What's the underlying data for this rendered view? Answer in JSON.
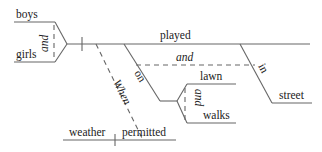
{
  "diagram": {
    "type": "sentence-diagram",
    "subjects": [
      "boys",
      "girls"
    ],
    "subject_conjunction": "and",
    "verb": "played",
    "compound_conjunction": "and",
    "preposition_1": "on",
    "prep_objects": [
      "lawn",
      "walks"
    ],
    "prep_objects_conjunction": "and",
    "preposition_2": "in",
    "prep_object_2": "street",
    "subordinator": "When",
    "clause_subject": "weather",
    "clause_verb": "permitted"
  }
}
